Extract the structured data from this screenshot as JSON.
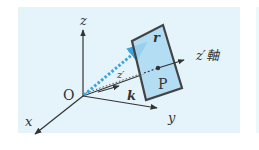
{
  "diagram": {
    "labels": {
      "z": "z",
      "x": "x",
      "y": "y",
      "origin": "O",
      "r": "r",
      "k": "k",
      "point": "P",
      "z_prime_small": "z′",
      "z_prime_axis": "z′軸"
    },
    "colors": {
      "panel_background": "#e4f4fa",
      "plane_fill": "#a9d8f0",
      "plane_edge": "#444444",
      "r_vector": "#3ba3e0",
      "axis": "#333333"
    }
  }
}
